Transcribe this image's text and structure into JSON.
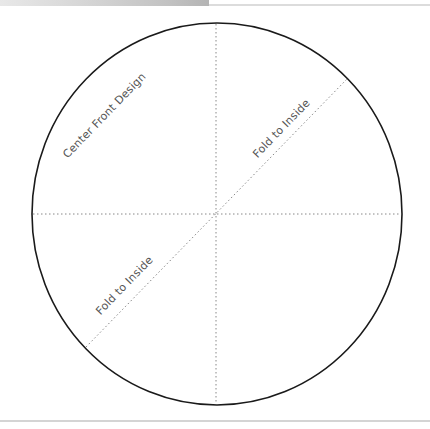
{
  "diagram": {
    "type": "fold-template",
    "shape": "circle",
    "labels": {
      "center_front": "Center Front Design",
      "fold_upper": "Fold to Inside",
      "fold_lower": "Fold to Inside"
    },
    "colors": {
      "outline": "#1a1a1a",
      "fold_lines": "#888888",
      "text": "#555555",
      "header_bar_start": "#e8e8e8",
      "header_bar_end": "#b4b4b4",
      "rule": "#d4d4d4"
    },
    "fold_lines": [
      {
        "name": "vertical",
        "style": "dotted"
      },
      {
        "name": "horizontal",
        "style": "dotted"
      },
      {
        "name": "diagonal",
        "style": "dotted"
      }
    ]
  }
}
